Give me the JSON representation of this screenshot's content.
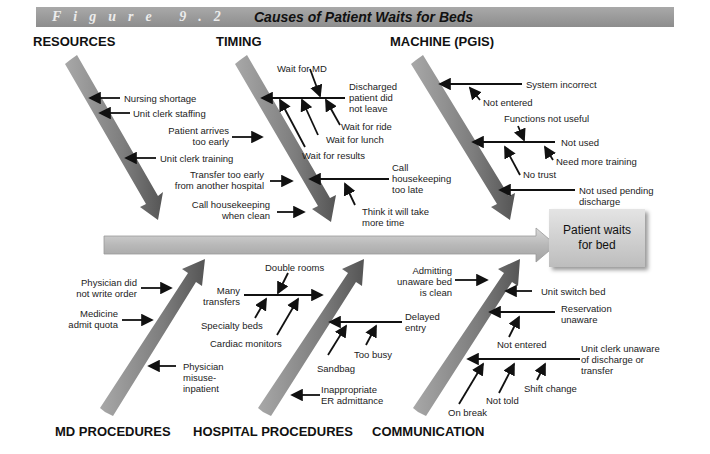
{
  "header": {
    "figure_label": "Figure 9.2",
    "title": "Causes of Patient Waits for Beds"
  },
  "effect": {
    "line1": "Patient waits",
    "line2": "for bed"
  },
  "categories": {
    "resources": "RESOURCES",
    "timing": "TIMING",
    "machine": "MACHINE (PGIS)",
    "md_procedures": "MD PROCEDURES",
    "hospital_procedures": "HOSPITAL PROCEDURES",
    "communication": "COMMUNICATION"
  },
  "causes": {
    "resources": [
      "Nursing shortage",
      "Unit clerk staffing",
      "Unit clerk training"
    ],
    "timing": {
      "wait_for_md": "Wait for MD",
      "discharged": [
        "Discharged",
        "patient did",
        "not leave"
      ],
      "wait_for_ride": "Wait for ride",
      "wait_for_lunch": "Wait for lunch",
      "wait_for_results": "Wait for results",
      "patient_arrives": [
        "Patient arrives",
        "too early"
      ],
      "transfer": [
        "Transfer too early",
        "from another hospital"
      ],
      "call_hk_clean": [
        "Call housekeeping",
        "when clean"
      ],
      "call_hk_late": [
        "Call",
        "housekeeping",
        "too late"
      ],
      "think_more_time": [
        "Think it will take",
        "more time"
      ]
    },
    "machine": {
      "system_incorrect": "System incorrect",
      "not_entered": "Not entered",
      "functions_not_useful": "Functions not useful",
      "not_used": "Not used",
      "need_more_training": "Need more training",
      "no_trust": "No trust",
      "not_used_pending": [
        "Not used pending",
        "discharge"
      ]
    },
    "md_procedures": {
      "physician_no_order": [
        "Physician did",
        "not write order"
      ],
      "medicine_quota": [
        "Medicine",
        "admit quota"
      ],
      "physician_misuse": [
        "Physician",
        "misuse-",
        "inpatient"
      ]
    },
    "hospital_procedures": {
      "double_rooms": "Double rooms",
      "many_transfers": [
        "Many",
        "transfers"
      ],
      "specialty_beds": "Specialty beds",
      "cardiac_monitors": "Cardiac monitors",
      "delayed_entry": [
        "Delayed",
        "entry"
      ],
      "too_busy": "Too busy",
      "sandbag": "Sandbag",
      "inappropriate_er": [
        "Inappropriate",
        "ER admittance"
      ]
    },
    "communication": {
      "admitting_unaware": [
        "Admitting",
        "unaware bed",
        "is clean"
      ],
      "unit_switch_bed": "Unit switch bed",
      "reservation_unaware": [
        "Reservation",
        "unaware"
      ],
      "not_entered": "Not entered",
      "unit_clerk_unaware": [
        "Unit clerk unaware",
        "of discharge or",
        "transfer"
      ],
      "shift_change": "Shift change",
      "not_told": "Not told",
      "on_break": "On break"
    }
  },
  "colors": {
    "banner": "#9a9a9a",
    "bone": "#8f8f8f",
    "spine": "#c9c9c9"
  }
}
